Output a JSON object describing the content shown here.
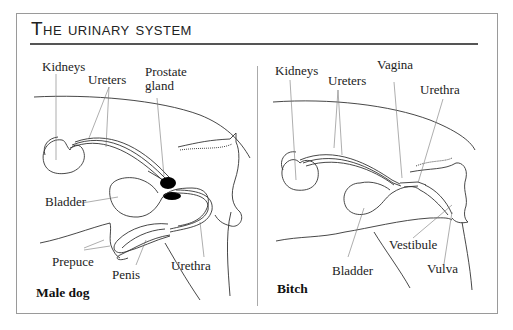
{
  "title": "The urinary system",
  "panels": {
    "male": {
      "caption": "Male dog",
      "labels": {
        "kidneys": "Kidneys",
        "ureters": "Ureters",
        "prostate_1": "Prostate",
        "prostate_2": "gland",
        "bladder": "Bladder",
        "prepuce": "Prepuce",
        "penis": "Penis",
        "urethra": "Urethra"
      }
    },
    "female": {
      "caption": "Bitch",
      "labels": {
        "kidneys": "Kidneys",
        "ureters": "Ureters",
        "vagina": "Vagina",
        "urethra": "Urethra",
        "vestibule": "Vestibule",
        "bladder": "Bladder",
        "vulva": "Vulva"
      }
    }
  },
  "colors": {
    "line": "#333333",
    "frame": "#9a9a9a",
    "prostate": "#000000"
  }
}
